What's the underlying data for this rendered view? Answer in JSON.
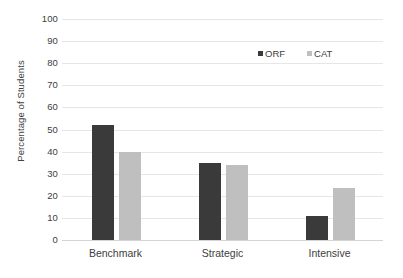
{
  "chart_data": {
    "type": "bar",
    "title": "",
    "subtitle": "",
    "xlabel": "",
    "ylabel": "Percentage of Students",
    "categories": [
      "Benchmark",
      "Strategic",
      "Intensive"
    ],
    "series": [
      {
        "name": "ORF",
        "color": "#3a3a3a",
        "values": [
          52,
          35,
          11
        ]
      },
      {
        "name": "CAT",
        "color": "#bfbfbf",
        "values": [
          40,
          34,
          23.5
        ]
      }
    ],
    "ylim": [
      0,
      100
    ],
    "ytick_step": 10,
    "yticks": [
      0,
      10,
      20,
      30,
      40,
      50,
      60,
      70,
      80,
      90,
      100
    ],
    "ytick_labels": [
      "0",
      "10",
      "20",
      "30",
      "40",
      "50",
      "60",
      "70",
      "80",
      "90",
      "100"
    ],
    "grid": {
      "horizontal": true,
      "vertical": false,
      "color": "#e6e6e6"
    },
    "legend": {
      "position": "top-right",
      "entries": [
        "ORF",
        "CAT"
      ]
    },
    "background": "#ffffff",
    "annotations": []
  },
  "legend": {
    "items": [
      {
        "label": "ORF",
        "swatch_name": "legend-swatch-orf"
      },
      {
        "label": "CAT",
        "swatch_name": "legend-swatch-cat"
      }
    ]
  }
}
